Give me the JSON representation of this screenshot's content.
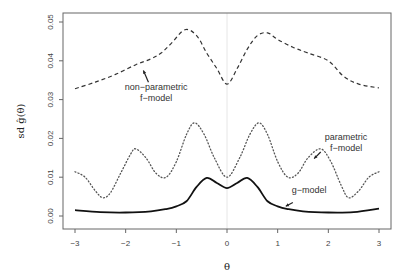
{
  "chart_data": {
    "type": "line",
    "title": "",
    "xlabel": "θ",
    "ylabel": "sd ĝ(θ)",
    "xlim": [
      -3,
      3
    ],
    "ylim": [
      0,
      0.05
    ],
    "xticks": [
      -3,
      -2,
      -1,
      0,
      1,
      2,
      3
    ],
    "xtick_labels": [
      "−3",
      "−2",
      "−1",
      "0",
      "1",
      "2",
      "3"
    ],
    "yticks": [
      0.0,
      0.01,
      0.02,
      0.03,
      0.04,
      0.05
    ],
    "ytick_labels": [
      "0.00",
      "0.01",
      "0.02",
      "0.03",
      "0.04",
      "0.05"
    ],
    "grid": false,
    "reference_line": {
      "x": 0,
      "color": "#e6e6e6"
    },
    "series": [
      {
        "name": "non-parametric f-model",
        "style": "dashed",
        "color": "#333333",
        "x": [
          -3,
          -2.6,
          -2.2,
          -1.8,
          -1.5,
          -1.3,
          -1.1,
          -0.83,
          -0.6,
          -0.4,
          -0.2,
          0,
          0.2,
          0.4,
          0.6,
          0.8,
          1.0,
          1.3,
          1.6,
          2.0,
          2.3,
          2.6,
          3.0
        ],
        "values": [
          0.0328,
          0.0345,
          0.0365,
          0.039,
          0.0405,
          0.042,
          0.0445,
          0.048,
          0.0465,
          0.042,
          0.038,
          0.034,
          0.038,
          0.043,
          0.0465,
          0.0472,
          0.0455,
          0.0435,
          0.042,
          0.04,
          0.036,
          0.034,
          0.033
        ]
      },
      {
        "name": "parametric f-model",
        "style": "dotted",
        "color": "#555555",
        "x": [
          -3,
          -2.8,
          -2.6,
          -2.45,
          -2.3,
          -2.1,
          -1.9,
          -1.8,
          -1.6,
          -1.4,
          -1.2,
          -1.0,
          -0.8,
          -0.64,
          -0.45,
          -0.25,
          0,
          0.25,
          0.45,
          0.63,
          0.8,
          1.0,
          1.2,
          1.4,
          1.6,
          1.85,
          2.05,
          2.25,
          2.4,
          2.6,
          2.8,
          3.0
        ],
        "values": [
          0.0114,
          0.01,
          0.0065,
          0.0047,
          0.006,
          0.011,
          0.016,
          0.0173,
          0.015,
          0.011,
          0.01,
          0.014,
          0.021,
          0.024,
          0.021,
          0.015,
          0.01,
          0.015,
          0.021,
          0.024,
          0.021,
          0.014,
          0.01,
          0.011,
          0.015,
          0.0173,
          0.014,
          0.008,
          0.0047,
          0.0065,
          0.01,
          0.0114
        ]
      },
      {
        "name": "g-model",
        "style": "solid",
        "color": "#111111",
        "x": [
          -3,
          -2.5,
          -2.0,
          -1.5,
          -1.2,
          -1.0,
          -0.8,
          -0.6,
          -0.4,
          -0.2,
          0,
          0.2,
          0.4,
          0.6,
          0.8,
          1.0,
          1.2,
          1.5,
          2.0,
          2.5,
          3.0
        ],
        "values": [
          0.0015,
          0.001,
          0.0009,
          0.0012,
          0.0018,
          0.0025,
          0.0038,
          0.0075,
          0.0098,
          0.0085,
          0.0072,
          0.0085,
          0.0098,
          0.0075,
          0.0038,
          0.0025,
          0.0018,
          0.0012,
          0.0009,
          0.001,
          0.0019
        ]
      }
    ],
    "annotations": [
      {
        "text_lines": [
          "non−parametric",
          "f−model"
        ],
        "points_to": "non-parametric f-model",
        "x": -1.4,
        "y": 0.0325
      },
      {
        "text_lines": [
          "parametric",
          "f−model"
        ],
        "points_to": "parametric f-model",
        "x": 2.35,
        "y": 0.0195
      },
      {
        "text_lines": [
          "g−model"
        ],
        "points_to": "g-model",
        "x": 1.7,
        "y": 0.0055
      }
    ]
  }
}
